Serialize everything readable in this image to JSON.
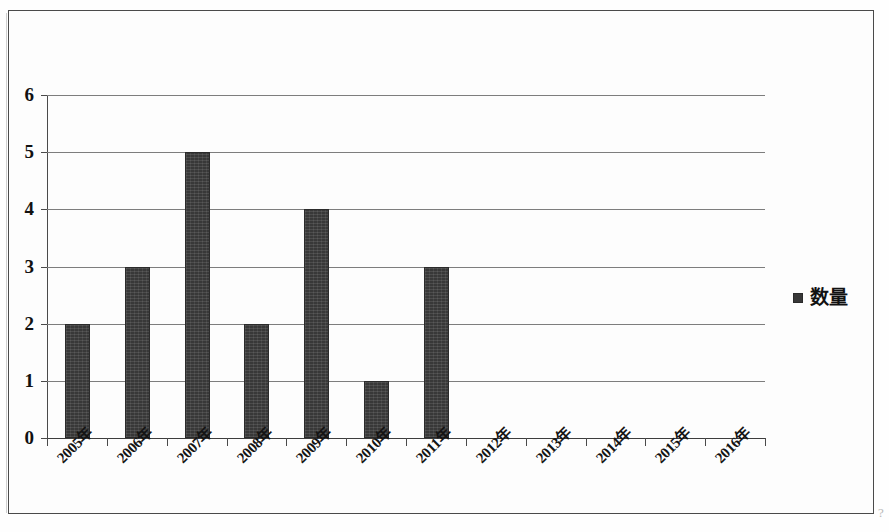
{
  "chart_data": {
    "type": "bar",
    "title": "",
    "xlabel": "",
    "ylabel": "",
    "categories": [
      "2005年",
      "2006年",
      "2007年",
      "2008年",
      "2009年",
      "2010年",
      "2011年",
      "2012年",
      "2013年",
      "2014年",
      "2015年",
      "2016年"
    ],
    "values": [
      2,
      3,
      5,
      2,
      4,
      1,
      3,
      0,
      0,
      0,
      0,
      0
    ],
    "series": [
      {
        "name": "数量",
        "values": [
          2,
          3,
          5,
          2,
          4,
          1,
          3,
          0,
          0,
          0,
          0,
          0
        ],
        "color": "#383838"
      }
    ],
    "ylim": [
      0,
      6
    ],
    "ytick_labels": [
      "0",
      "1",
      "2",
      "3",
      "4",
      "5",
      "6"
    ],
    "ytick_values": [
      0,
      1,
      2,
      3,
      4,
      5,
      6
    ],
    "grid": true,
    "grid_axis": "y",
    "legend": {
      "position": "right",
      "entries": [
        {
          "label": "数量",
          "marker": "square",
          "color": "#383838"
        }
      ]
    },
    "xtick_rotation": -45
  },
  "legend": {
    "label": "数量"
  },
  "artifact": {
    "mark": "?"
  },
  "colors": {
    "bar": "#383838",
    "grid": "#7d7d7d",
    "axis": "#4a4a4a",
    "text": "#111111",
    "background": "#fdfdfd"
  }
}
